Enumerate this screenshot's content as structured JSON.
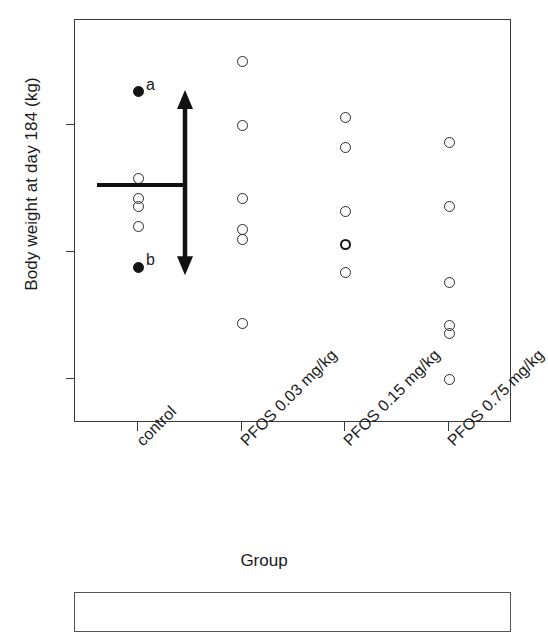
{
  "chart_data": {
    "type": "scatter",
    "title": "",
    "xlabel": "Group",
    "ylabel": "Body weight at day 184 (kg)",
    "ylim": [
      2.88,
      4.38
    ],
    "ytick_values": [
      4.0,
      3.5,
      3.0
    ],
    "ytick_labels": [
      "4.0",
      "3.5",
      "3.0"
    ],
    "grid": false,
    "legend": "none",
    "categories": [
      "control",
      "PFOS 0.03 mg/kg",
      "PFOS 0.15 mg/kg",
      "PFOS 0.75 mg/kg"
    ],
    "series": [
      {
        "name": "control",
        "category_index": 0,
        "points": [
          {
            "value": 4.13,
            "marker": "filled",
            "label": "a"
          },
          {
            "value": 3.79,
            "marker": "open",
            "label": ""
          },
          {
            "value": 3.71,
            "marker": "open",
            "label": ""
          },
          {
            "value": 3.68,
            "marker": "open",
            "label": ""
          },
          {
            "value": 3.6,
            "marker": "open",
            "label": ""
          },
          {
            "value": 3.44,
            "marker": "filled",
            "label": "b"
          }
        ]
      },
      {
        "name": "PFOS 0.03 mg/kg",
        "category_index": 1,
        "points": [
          {
            "value": 4.25,
            "marker": "open",
            "label": ""
          },
          {
            "value": 4.0,
            "marker": "open",
            "label": ""
          },
          {
            "value": 3.71,
            "marker": "open",
            "label": ""
          },
          {
            "value": 3.59,
            "marker": "open",
            "label": ""
          },
          {
            "value": 3.55,
            "marker": "open",
            "label": ""
          },
          {
            "value": 3.22,
            "marker": "open",
            "label": ""
          }
        ]
      },
      {
        "name": "PFOS 0.15 mg/kg",
        "category_index": 2,
        "points": [
          {
            "value": 4.03,
            "marker": "open",
            "label": ""
          },
          {
            "value": 3.91,
            "marker": "open",
            "label": ""
          },
          {
            "value": 3.66,
            "marker": "open",
            "label": ""
          },
          {
            "value": 3.53,
            "marker": "open-bold",
            "label": ""
          },
          {
            "value": 3.42,
            "marker": "open",
            "label": ""
          }
        ]
      },
      {
        "name": "PFOS 0.75 mg/kg",
        "category_index": 3,
        "points": [
          {
            "value": 3.93,
            "marker": "open",
            "label": ""
          },
          {
            "value": 3.68,
            "marker": "open",
            "label": ""
          },
          {
            "value": 3.38,
            "marker": "open",
            "label": ""
          },
          {
            "value": 3.21,
            "marker": "open",
            "label": ""
          },
          {
            "value": 3.18,
            "marker": "open",
            "label": ""
          },
          {
            "value": 3.0,
            "marker": "open",
            "label": ""
          }
        ]
      }
    ],
    "annotations": {
      "mean_line": {
        "name": "control-mean-line",
        "value": 3.77,
        "x_start_category": 0,
        "x_span_px": 88
      },
      "range_arrow": {
        "name": "control-range-arrow",
        "top_value": 4.13,
        "bottom_value": 3.44,
        "double_headed": true
      },
      "point_labels": [
        {
          "text": "a",
          "value": 4.13,
          "category_index": 0
        },
        {
          "text": "b",
          "value": 3.44,
          "category_index": 0
        }
      ]
    },
    "marker_colors": {
      "open": "#2b2b2b",
      "filled": "#141414",
      "axis": "#3a3a3a"
    }
  }
}
